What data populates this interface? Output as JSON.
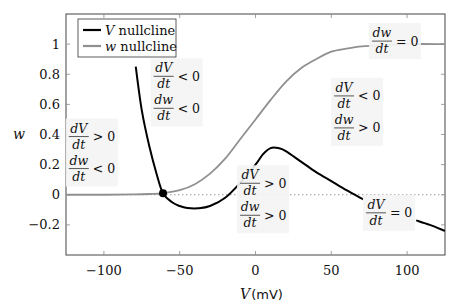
{
  "chart_data": {
    "type": "line",
    "title": "",
    "xlabel": "V",
    "xlabel_unit": "(mV)",
    "ylabel": "w",
    "xlim": [
      -125,
      125
    ],
    "ylim": [
      -0.4,
      1.2
    ],
    "xticks": [
      -100,
      -50,
      0,
      50,
      100
    ],
    "xtick_labels": [
      "−100",
      "−50",
      "0",
      "50",
      "100"
    ],
    "yticks": [
      -0.2,
      0,
      0.2,
      0.4,
      0.6,
      0.8,
      1
    ],
    "ytick_labels": [
      "−0.2",
      "0",
      "0.2",
      "0.4",
      "0.6",
      "0.8",
      "1"
    ],
    "grid": false,
    "legend_position": "upper left",
    "series": [
      {
        "name": "V nullcline",
        "legend_label_var": "V",
        "legend_label_rest": " nullcline",
        "color": "#000000",
        "x": [
          -79,
          -75,
          -70,
          -65,
          -61,
          -55,
          -50,
          -45,
          -38,
          -30,
          -20,
          -10,
          0,
          5,
          10,
          15,
          20,
          30,
          40,
          50,
          60,
          71,
          106,
          115,
          125
        ],
        "y": [
          0.85,
          0.56,
          0.32,
          0.13,
          0.01,
          -0.05,
          -0.075,
          -0.088,
          -0.09,
          -0.075,
          -0.02,
          0.08,
          0.2,
          0.27,
          0.31,
          0.31,
          0.29,
          0.22,
          0.15,
          0.09,
          0.03,
          -0.03,
          -0.17,
          -0.2,
          -0.24
        ],
        "gap_x": [
          71,
          106
        ]
      },
      {
        "name": "w nullcline",
        "legend_label_var": "w",
        "legend_label_rest": " nullcline",
        "color": "#909090",
        "x": [
          -125,
          -100,
          -80,
          -70,
          -61,
          -50,
          -40,
          -30,
          -20,
          -10,
          0,
          10,
          20,
          30,
          40,
          50,
          60,
          70,
          80,
          100,
          125
        ],
        "y": [
          0.0,
          0.0,
          0.002,
          0.005,
          0.01,
          0.03,
          0.07,
          0.14,
          0.24,
          0.37,
          0.5,
          0.63,
          0.75,
          0.84,
          0.9,
          0.95,
          0.97,
          0.985,
          0.99,
          1.0,
          1.0
        ]
      }
    ],
    "reference_lines": [
      {
        "type": "horizontal",
        "y": 0,
        "style": "dotted",
        "color": "#999999"
      }
    ],
    "points": [
      {
        "name": "fixed-point",
        "x": -61,
        "y": 0.01,
        "color": "#000000"
      }
    ],
    "annotations": [
      {
        "id": "region-left",
        "x": -108,
        "y": 0.28,
        "lines": [
          [
            "dV",
            "dt",
            "> 0"
          ],
          [
            "dw",
            "dt",
            "< 0"
          ]
        ]
      },
      {
        "id": "region-top-middle",
        "x": -52,
        "y": 0.68,
        "lines": [
          [
            "dV",
            "dt",
            "< 0"
          ],
          [
            "dw",
            "dt",
            "< 0"
          ]
        ]
      },
      {
        "id": "region-right",
        "x": 67,
        "y": 0.55,
        "lines": [
          [
            "dV",
            "dt",
            "< 0"
          ],
          [
            "dw",
            "dt",
            "> 0"
          ]
        ]
      },
      {
        "id": "region-bottom-middle",
        "x": 5,
        "y": -0.03,
        "lines": [
          [
            "dV",
            "dt",
            "> 0"
          ],
          [
            "dw",
            "dt",
            "> 0"
          ]
        ]
      },
      {
        "id": "label-w-nullcline",
        "x": 92,
        "y": 1.02,
        "lines": [
          [
            "dw",
            "dt",
            "= 0"
          ]
        ]
      },
      {
        "id": "label-v-nullcline",
        "x": 88,
        "y": -0.12,
        "lines": [
          [
            "dV",
            "dt",
            "= 0"
          ]
        ]
      }
    ]
  }
}
